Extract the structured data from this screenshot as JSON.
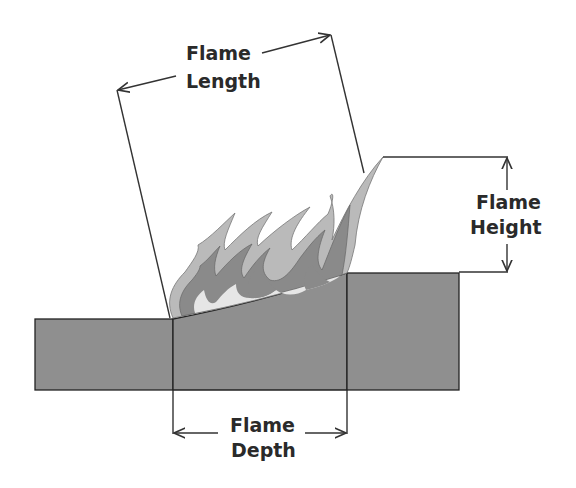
{
  "diagram": {
    "labels": {
      "flame_length": [
        "Flame",
        "Length"
      ],
      "flame_height": [
        "Flame",
        "Height"
      ],
      "flame_depth": [
        "Flame",
        "Depth"
      ]
    },
    "colors": {
      "ground": "#8f8f8f",
      "flame_outer": "#bababa",
      "flame_middle": "#8a8a8a",
      "flame_inner": "#e6e6e6",
      "line": "#333333",
      "text": "#2a2a2a"
    }
  }
}
